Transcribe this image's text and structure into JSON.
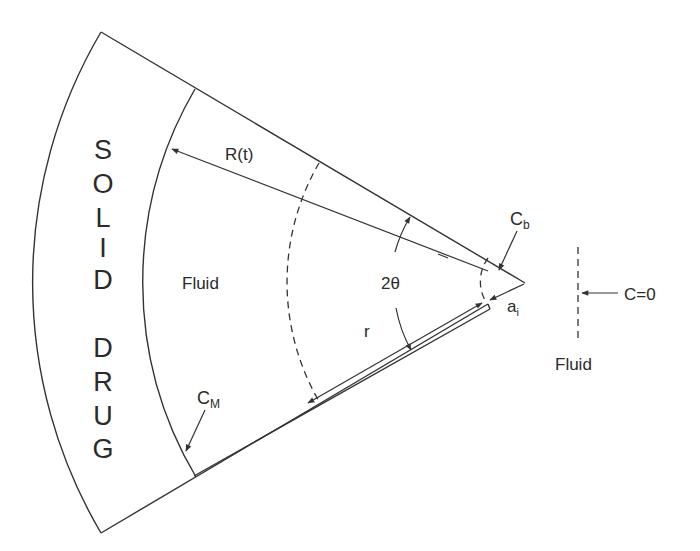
{
  "diagram": {
    "type": "wedge-geometry",
    "regions": {
      "solid_drug_letters": [
        "S",
        "O",
        "L",
        "I",
        "D",
        "",
        "D",
        "R",
        "U",
        "G"
      ],
      "fluid_inner_label": "Fluid",
      "fluid_outer_label": "Fluid"
    },
    "labels": {
      "radius_moving": "R(t)",
      "radius": "r",
      "angle": "2θ",
      "conc_bulk_base": "C",
      "conc_bulk_sub": "b",
      "conc_matrix_base": "C",
      "conc_matrix_sub": "M",
      "tip_radius_base": "a",
      "tip_radius_sub": "i",
      "boundary_condition": "C=0"
    },
    "colors": {
      "stroke": "#333333",
      "text": "#2a2a2a",
      "background": "#ffffff"
    }
  }
}
